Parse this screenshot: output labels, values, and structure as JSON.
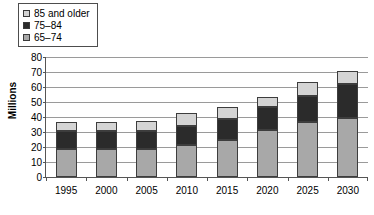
{
  "legend": {
    "position": "top-left",
    "items": [
      {
        "label": "85 and older",
        "color": "#d4d4d4",
        "swatch_name": "legend-swatch-85-and-older"
      },
      {
        "label": "75–84",
        "color": "#2b2b2b",
        "swatch_name": "legend-swatch-75-84"
      },
      {
        "label": "65–74",
        "color": "#a8a8a8",
        "swatch_name": "legend-swatch-65-74"
      }
    ]
  },
  "axes": {
    "ylabel": "Millions",
    "yticks": [
      "0",
      "10",
      "20",
      "30",
      "40",
      "50",
      "60",
      "70",
      "80"
    ],
    "xticks": [
      "1995",
      "2000",
      "2005",
      "2010",
      "2015",
      "2020",
      "2025",
      "2030"
    ]
  },
  "chart_data": {
    "type": "bar",
    "stacked": true,
    "title": "",
    "xlabel": "",
    "ylabel": "Millions",
    "ylim": [
      0,
      80
    ],
    "ytick_step": 10,
    "grid": true,
    "legend_position": "top-left",
    "categories": [
      "1995",
      "2000",
      "2005",
      "2010",
      "2015",
      "2020",
      "2025",
      "2030"
    ],
    "series": [
      {
        "name": "65–74",
        "color": "#a8a8a8",
        "values": [
          18.5,
          18.5,
          18.5,
          21.5,
          25.0,
          31.5,
          36.5,
          39.5
        ]
      },
      {
        "name": "75–84",
        "color": "#2b2b2b",
        "values": [
          12.5,
          12.0,
          12.5,
          12.5,
          13.5,
          15.5,
          17.5,
          22.5
        ]
      },
      {
        "name": "85 and older",
        "color": "#d4d4d4",
        "values": [
          5.5,
          6.0,
          6.5,
          8.5,
          8.5,
          6.5,
          9.5,
          9.0
        ]
      }
    ],
    "totals": [
      36.5,
      36.5,
      37.5,
      42.5,
      47.0,
      53.5,
      63.5,
      71.0
    ]
  }
}
